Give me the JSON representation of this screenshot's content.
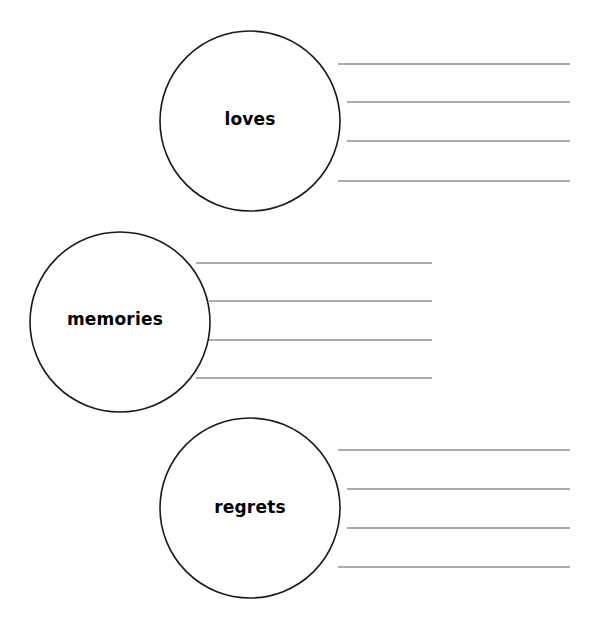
{
  "page": {
    "width": 590,
    "height": 632,
    "background_color": "#ffffff",
    "circle_stroke_color": "#1a1a1a",
    "line_stroke_color": "#5a5a5a",
    "label_color": "#000000"
  },
  "groups": [
    {
      "id": "loves",
      "label": "loves",
      "circle": {
        "cx": 250,
        "cy": 121,
        "r": 90
      },
      "label_x": 250,
      "label_y": 120,
      "lines": [
        {
          "x1": 338,
          "x2": 570,
          "y": 64
        },
        {
          "x1": 347,
          "x2": 570,
          "y": 102
        },
        {
          "x1": 347,
          "x2": 570,
          "y": 141
        },
        {
          "x1": 338,
          "x2": 570,
          "y": 181
        }
      ]
    },
    {
      "id": "memories",
      "label": "memories",
      "circle": {
        "cx": 120,
        "cy": 322,
        "r": 90
      },
      "label_x": 115,
      "label_y": 320,
      "lines": [
        {
          "x1": 196,
          "x2": 432,
          "y": 263
        },
        {
          "x1": 209,
          "x2": 432,
          "y": 301
        },
        {
          "x1": 209,
          "x2": 432,
          "y": 340
        },
        {
          "x1": 196,
          "x2": 432,
          "y": 378
        }
      ]
    },
    {
      "id": "regrets",
      "label": "regrets",
      "circle": {
        "cx": 250,
        "cy": 508,
        "r": 90
      },
      "label_x": 250,
      "label_y": 508,
      "lines": [
        {
          "x1": 338,
          "x2": 570,
          "y": 450
        },
        {
          "x1": 347,
          "x2": 570,
          "y": 489
        },
        {
          "x1": 347,
          "x2": 570,
          "y": 528
        },
        {
          "x1": 338,
          "x2": 570,
          "y": 567
        }
      ]
    }
  ]
}
